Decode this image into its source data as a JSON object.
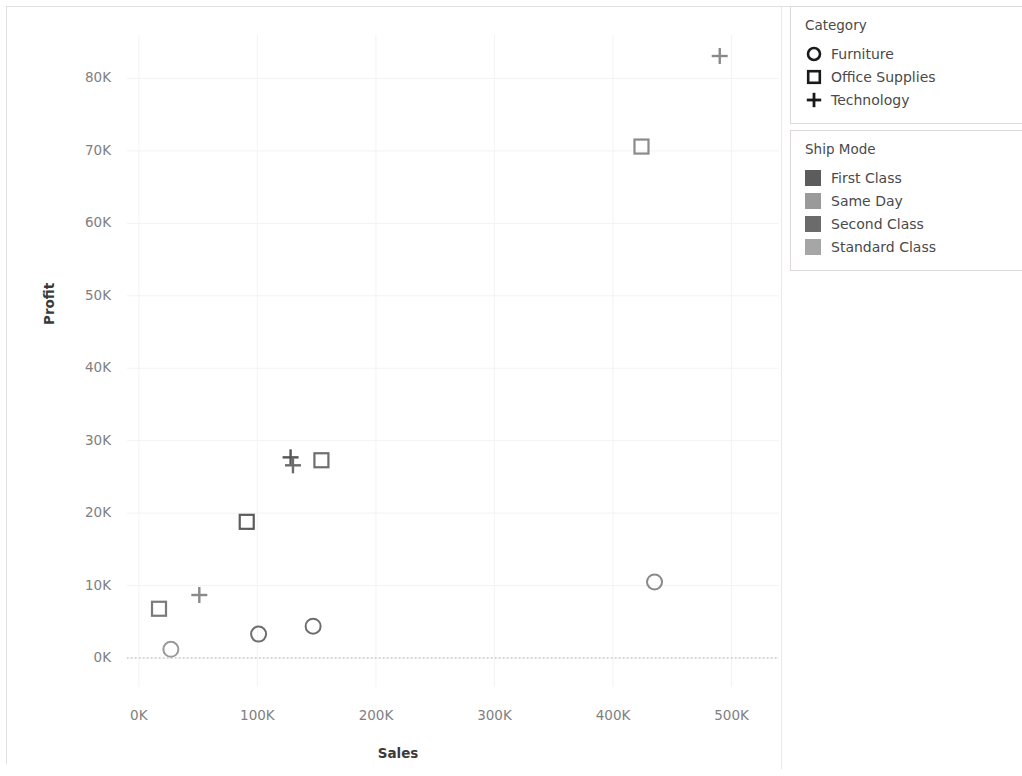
{
  "chart_data": {
    "type": "scatter",
    "title": "",
    "xlabel": "Sales",
    "ylabel": "Profit",
    "xlim": [
      -10000,
      540000
    ],
    "ylim": [
      -4000,
      86000
    ],
    "xticks": [
      "0K",
      "100K",
      "200K",
      "300K",
      "400K",
      "500K"
    ],
    "xtick_values": [
      0,
      100000,
      200000,
      300000,
      400000,
      500000
    ],
    "yticks": [
      "0K",
      "10K",
      "20K",
      "30K",
      "40K",
      "50K",
      "60K",
      "70K",
      "80K"
    ],
    "ytick_values": [
      0,
      10000,
      20000,
      30000,
      40000,
      50000,
      60000,
      70000,
      80000
    ],
    "grid": true,
    "zero_line": true,
    "legend_position": "right",
    "mark_encoding": {
      "shape": "Category",
      "color": "Ship Mode"
    },
    "points": [
      {
        "shape": "circle",
        "category": "Furniture",
        "ship_mode": "Same Day",
        "x": 27000,
        "y": 1200,
        "color": "#9a9a9a"
      },
      {
        "shape": "circle",
        "category": "Furniture",
        "ship_mode": "First Class",
        "x": 101000,
        "y": 3300,
        "color": "#6e6e6e"
      },
      {
        "shape": "circle",
        "category": "Furniture",
        "ship_mode": "Second Class",
        "x": 147000,
        "y": 4400,
        "color": "#6e6e6e"
      },
      {
        "shape": "circle",
        "category": "Furniture",
        "ship_mode": "Standard Class",
        "x": 435000,
        "y": 10500,
        "color": "#8a8a8a"
      },
      {
        "shape": "square",
        "category": "Office Supplies",
        "ship_mode": "Same Day",
        "x": 17000,
        "y": 6800,
        "color": "#7a7a7a"
      },
      {
        "shape": "square",
        "category": "Office Supplies",
        "ship_mode": "First Class",
        "x": 91000,
        "y": 18800,
        "color": "#5c5c5c"
      },
      {
        "shape": "square",
        "category": "Office Supplies",
        "ship_mode": "Second Class",
        "x": 154000,
        "y": 27300,
        "color": "#6e6e6e"
      },
      {
        "shape": "square",
        "category": "Office Supplies",
        "ship_mode": "Standard Class",
        "x": 424000,
        "y": 70600,
        "color": "#8a8a8a"
      },
      {
        "shape": "plus",
        "category": "Technology",
        "ship_mode": "Same Day",
        "x": 51000,
        "y": 8700,
        "color": "#8a8a8a"
      },
      {
        "shape": "plus",
        "category": "Technology",
        "ship_mode": "First Class",
        "x": 128000,
        "y": 27700,
        "color": "#555555"
      },
      {
        "shape": "plus",
        "category": "Technology",
        "ship_mode": "Second Class",
        "x": 130000,
        "y": 26600,
        "color": "#6b6b6b"
      },
      {
        "shape": "plus",
        "category": "Technology",
        "ship_mode": "Standard Class",
        "x": 490000,
        "y": 83100,
        "color": "#8a8a8a"
      }
    ]
  },
  "axes": {
    "y_title": "Profit",
    "x_title": "Sales",
    "y_labels": [
      "80K",
      "70K",
      "60K",
      "50K",
      "40K",
      "30K",
      "20K",
      "10K",
      "0K"
    ],
    "x_labels": [
      "0K",
      "100K",
      "200K",
      "300K",
      "400K",
      "500K"
    ]
  },
  "legends": [
    {
      "id": "category",
      "title": "Category",
      "items": [
        {
          "label": "Furniture",
          "symbol": "circle-marker-icon",
          "color": "#1a1a1a"
        },
        {
          "label": "Office Supplies",
          "symbol": "square-marker-icon",
          "color": "#1a1a1a"
        },
        {
          "label": "Technology",
          "symbol": "plus-marker-icon",
          "color": "#1a1a1a"
        }
      ]
    },
    {
      "id": "ship-mode",
      "title": "Ship Mode",
      "items": [
        {
          "label": "First Class",
          "symbol": "color-swatch-icon",
          "color": "#5c5c5c"
        },
        {
          "label": "Same Day",
          "symbol": "color-swatch-icon",
          "color": "#9a9a9a"
        },
        {
          "label": "Second Class",
          "symbol": "color-swatch-icon",
          "color": "#6b6b6b"
        },
        {
          "label": "Standard Class",
          "symbol": "color-swatch-icon",
          "color": "#a6a6a6"
        }
      ]
    }
  ]
}
